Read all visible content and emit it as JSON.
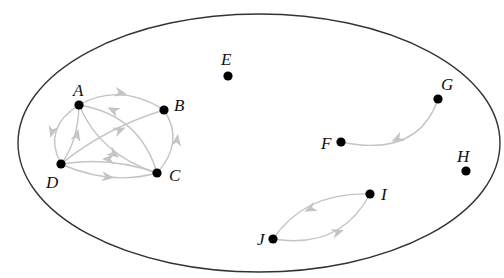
{
  "diagram": {
    "type": "directed-graph",
    "boundary": {
      "shape": "ellipse",
      "cx": 259,
      "cy": 143,
      "rx": 241,
      "ry": 129,
      "stroke": "#333333"
    },
    "colors": {
      "node": "#000000",
      "edge": "#c4c4c4",
      "label": "#111111"
    },
    "nodes": [
      {
        "id": "A",
        "label": "A",
        "x": 79,
        "y": 105,
        "lx": 73,
        "ly": 80
      },
      {
        "id": "B",
        "label": "B",
        "x": 164,
        "y": 110,
        "lx": 174,
        "ly": 96
      },
      {
        "id": "C",
        "label": "C",
        "x": 157,
        "y": 173,
        "lx": 169,
        "ly": 168
      },
      {
        "id": "D",
        "label": "D",
        "x": 61,
        "y": 164,
        "lx": 45,
        "ly": 174
      },
      {
        "id": "E",
        "label": "E",
        "x": 228,
        "y": 76,
        "lx": 221,
        "ly": 50
      },
      {
        "id": "F",
        "label": "F",
        "x": 341,
        "y": 142,
        "lx": 321,
        "ly": 135
      },
      {
        "id": "G",
        "label": "G",
        "x": 438,
        "y": 99,
        "lx": 441,
        "ly": 76
      },
      {
        "id": "H",
        "label": "H",
        "x": 466,
        "y": 171,
        "lx": 456,
        "ly": 147
      },
      {
        "id": "I",
        "label": "I",
        "x": 370,
        "y": 194,
        "lx": 381,
        "ly": 186
      },
      {
        "id": "J",
        "label": "J",
        "x": 273,
        "y": 239,
        "lx": 256,
        "ly": 231
      }
    ],
    "edges": [
      {
        "from": "A",
        "to": "B"
      },
      {
        "from": "A",
        "to": "D"
      },
      {
        "from": "D",
        "to": "A"
      },
      {
        "from": "A",
        "to": "C"
      },
      {
        "from": "C",
        "to": "A"
      },
      {
        "from": "D",
        "to": "B"
      },
      {
        "from": "C",
        "to": "D"
      },
      {
        "from": "D",
        "to": "C"
      },
      {
        "from": "C",
        "to": "B"
      },
      {
        "from": "G",
        "to": "F"
      },
      {
        "from": "I",
        "to": "J"
      },
      {
        "from": "J",
        "to": "I"
      }
    ]
  }
}
